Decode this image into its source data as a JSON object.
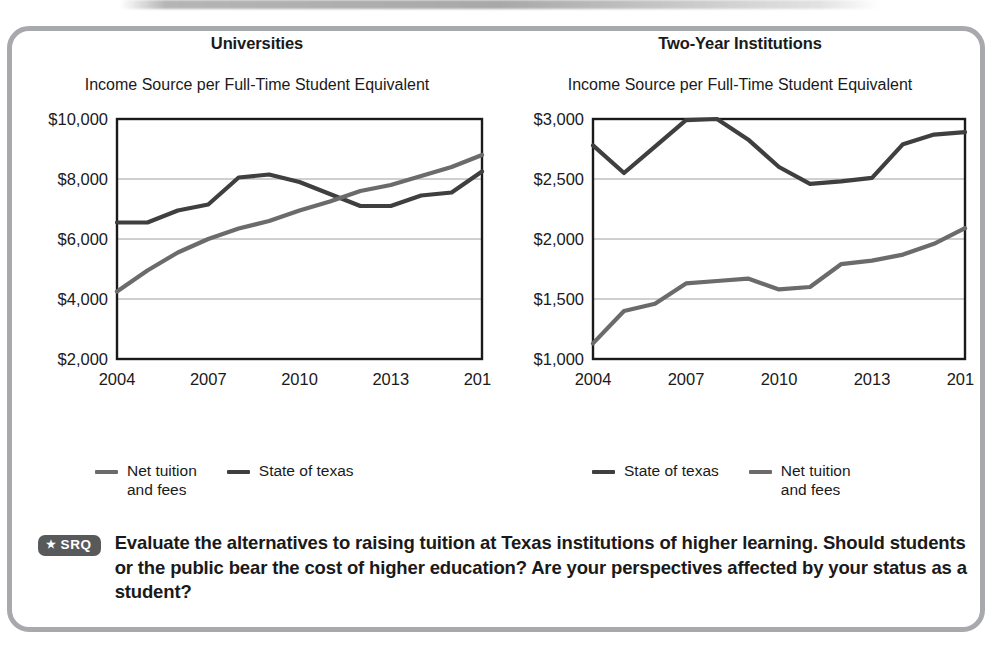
{
  "figure": {
    "srq": {
      "badge_star": "★",
      "badge_label": "SRQ",
      "prompt": "Evaluate the alternatives to raising tuition at Texas institutions of higher learning. Should students or the public bear the cost of higher education? Are your perspectives affected by your status as a student?"
    },
    "colors": {
      "state_of_texas": "#3f3f3f",
      "net_tuition": "#6b6b6b",
      "frame": "#a7a9ac",
      "gridline": "#a0a0a0",
      "axis": "#1a1a1a",
      "badge_bg": "#58595b"
    }
  },
  "panels": {
    "left": {
      "title": "Universities",
      "subtitle": "Income Source per Full-Time\nStudent Equivalent",
      "legend": [
        {
          "label": "Net tuition\nand fees",
          "color": "#6b6b6b"
        },
        {
          "label": "State of texas",
          "color": "#3f3f3f"
        }
      ]
    },
    "right": {
      "title": "Two-Year Institutions",
      "subtitle": "Income Source per Full-Time\nStudent Equivalent",
      "legend": [
        {
          "label": "State of texas",
          "color": "#3f3f3f"
        },
        {
          "label": "Net tuition\nand fees",
          "color": "#6b6b6b"
        }
      ]
    }
  },
  "chart_data": [
    {
      "id": "universities",
      "type": "line",
      "title": "Universities",
      "subtitle": "Income Source per Full-Time Student Equivalent",
      "xlabel": "",
      "ylabel": "",
      "x": [
        2004,
        2005,
        2006,
        2007,
        2008,
        2009,
        2010,
        2011,
        2012,
        2013,
        2014,
        2015,
        2016
      ],
      "xticks": [
        2004,
        2007,
        2010,
        2013,
        2016
      ],
      "xticklabels": [
        "2004",
        "2007",
        "2010",
        "2013",
        "2016"
      ],
      "xlim": [
        2004,
        2016
      ],
      "ylim": [
        2000,
        10000
      ],
      "yticks": [
        2000,
        4000,
        6000,
        8000,
        10000
      ],
      "yticklabels": [
        "$2,000",
        "$4,000",
        "$6,000",
        "$8,000",
        "$10,000"
      ],
      "grid": true,
      "grid_axis": "y",
      "legend_position": "below",
      "series": [
        {
          "name": "State of texas",
          "color": "#3f3f3f",
          "values": [
            6550,
            6550,
            6950,
            7150,
            8050,
            8150,
            7900,
            7500,
            7100,
            7100,
            7450,
            7550,
            8250
          ]
        },
        {
          "name": "Net tuition and fees",
          "color": "#6b6b6b",
          "values": [
            4250,
            4950,
            5550,
            6000,
            6350,
            6600,
            6950,
            7250,
            7600,
            7800,
            8100,
            8400,
            8800
          ]
        }
      ]
    },
    {
      "id": "two-year-institutions",
      "type": "line",
      "title": "Two-Year Institutions",
      "subtitle": "Income Source per Full-Time Student Equivalent",
      "xlabel": "",
      "ylabel": "",
      "x": [
        2004,
        2005,
        2006,
        2007,
        2008,
        2009,
        2010,
        2011,
        2012,
        2013,
        2014,
        2015,
        2016
      ],
      "xticks": [
        2004,
        2007,
        2010,
        2013,
        2016
      ],
      "xticklabels": [
        "2004",
        "2007",
        "2010",
        "2013",
        "2016"
      ],
      "xlim": [
        2004,
        2016
      ],
      "ylim": [
        1000,
        3000
      ],
      "yticks": [
        1000,
        1500,
        2000,
        2500,
        3000
      ],
      "yticklabels": [
        "$1,000",
        "$1,500",
        "$2,000",
        "$2,500",
        "$3,000"
      ],
      "grid": true,
      "grid_axis": "y",
      "legend_position": "below",
      "series": [
        {
          "name": "State of texas",
          "color": "#3f3f3f",
          "values": [
            2780,
            2550,
            2770,
            2990,
            3000,
            2830,
            2600,
            2460,
            2480,
            2510,
            2790,
            2870,
            2890
          ]
        },
        {
          "name": "Net tuition and fees",
          "color": "#6b6b6b",
          "values": [
            1130,
            1400,
            1460,
            1630,
            1650,
            1670,
            1580,
            1600,
            1790,
            1820,
            1870,
            1960,
            2090
          ]
        }
      ]
    }
  ]
}
